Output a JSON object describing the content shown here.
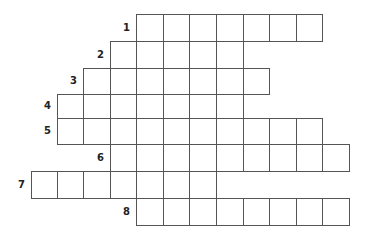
{
  "puzzle": {
    "type": "crossword",
    "grid": {
      "col_edges": [
        31,
        57,
        83,
        110,
        136,
        163,
        189,
        216,
        243,
        269,
        296,
        322,
        349
      ],
      "rows": [
        {
          "number": "1",
          "top": 14,
          "height": 27,
          "start_col": 4,
          "length": 7
        },
        {
          "number": "2",
          "top": 41,
          "height": 27,
          "start_col": 3,
          "length": 5
        },
        {
          "number": "3",
          "top": 68,
          "height": 26,
          "start_col": 2,
          "length": 7
        },
        {
          "number": "4",
          "top": 94,
          "height": 24,
          "start_col": 1,
          "length": 7
        },
        {
          "number": "5",
          "top": 118,
          "height": 26,
          "start_col": 1,
          "length": 10
        },
        {
          "number": "6",
          "top": 144,
          "height": 27,
          "start_col": 3,
          "length": 9
        },
        {
          "number": "7",
          "top": 171,
          "height": 27,
          "start_col": 0,
          "length": 7
        },
        {
          "number": "8",
          "top": 198,
          "height": 27,
          "start_col": 4,
          "length": 8
        }
      ]
    }
  }
}
